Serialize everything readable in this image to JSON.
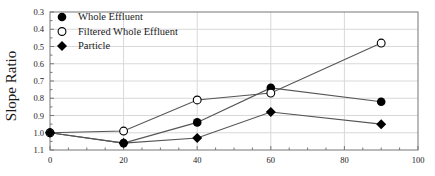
{
  "chart_data": {
    "type": "line",
    "title": "",
    "subtitle": "",
    "xlabel": "",
    "ylabel": "Slope Ratio",
    "xlim": [
      0,
      100
    ],
    "ylim": [
      0.3,
      1.1
    ],
    "y_axis_inverted": true,
    "grid": true,
    "legend_position": "top-left",
    "xticks": [
      0,
      20,
      40,
      60,
      80,
      100
    ],
    "xtick_labels": [
      "0",
      "20",
      "40",
      "60",
      "80",
      "100"
    ],
    "yticks": [
      0.3,
      0.4,
      0.5,
      0.6,
      0.7,
      0.8,
      0.9,
      1.0,
      1.1
    ],
    "ytick_labels": [
      "0.3",
      "0.4",
      "0.5",
      "0.6",
      "0.7",
      "0.8",
      "0.9",
      "1.0",
      "1.1"
    ],
    "series": [
      {
        "name": "Whole Effluent",
        "marker": "filled-circle",
        "color": "#000000",
        "x": [
          0,
          20,
          40,
          60,
          90
        ],
        "values": [
          1.0,
          1.06,
          0.94,
          0.74,
          0.82
        ]
      },
      {
        "name": "Filtered Whole Effluent",
        "marker": "open-circle",
        "color": "#000000",
        "x": [
          0,
          20,
          40,
          60,
          90
        ],
        "values": [
          1.0,
          0.99,
          0.81,
          0.77,
          0.48
        ]
      },
      {
        "name": "Particle",
        "marker": "filled-diamond",
        "color": "#000000",
        "x": [
          0,
          20,
          40,
          60,
          90
        ],
        "values": [
          1.0,
          1.06,
          1.03,
          0.88,
          0.95
        ]
      }
    ]
  },
  "legend": {
    "entries": [
      {
        "label": "Whole Effluent",
        "marker": "filled-circle"
      },
      {
        "label": "Filtered Whole Effluent",
        "marker": "open-circle"
      },
      {
        "label": "Particle",
        "marker": "filled-diamond"
      }
    ]
  },
  "axes": {
    "y_title": "Slope Ratio"
  },
  "colors": {
    "line": "#555555",
    "marker": "#000000",
    "grid": "#d8d8d8",
    "frame": "#777777",
    "text": "#1a1a1a",
    "background": "#ffffff"
  }
}
